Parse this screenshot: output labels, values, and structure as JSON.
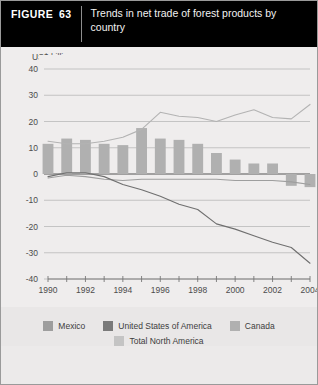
{
  "figure": {
    "tag_word": "FIGURE",
    "tag_number": "63",
    "title": "Trends in net trade of forest products by country"
  },
  "legend": {
    "position": "bottom",
    "rows": [
      [
        {
          "label": "Mexico",
          "color": "#9e9e9e",
          "kind": "line"
        },
        {
          "label": "United States of America",
          "color": "#7a7a7a",
          "kind": "line"
        },
        {
          "label": "Canada",
          "color": "#b0b0b0",
          "kind": "bar"
        }
      ],
      [
        {
          "label": "Total North America",
          "color": "#c4c4c4",
          "kind": "line"
        }
      ]
    ]
  },
  "chart_data": {
    "type": "bar",
    "title": "Trends in net trade of forest products by country",
    "xlabel": "",
    "ylabel": "US$ billion",
    "ylim": [
      -40,
      40
    ],
    "yticks": [
      40,
      30,
      20,
      10,
      0,
      -10,
      -20,
      -30,
      -40
    ],
    "ytick_labels": [
      "40",
      "30",
      "20",
      "10",
      "0",
      "-10",
      "-20",
      "-30",
      "-40"
    ],
    "grid": true,
    "x": [
      1990,
      1991,
      1992,
      1993,
      1994,
      1995,
      1996,
      1997,
      1998,
      1999,
      2000,
      2001,
      2002,
      2003,
      2004
    ],
    "xtick_labels": [
      "1990",
      "",
      "1992",
      "",
      "1994",
      "",
      "1996",
      "",
      "1998",
      "",
      "2000",
      "",
      "2002",
      "",
      "2004"
    ],
    "xtick_labels_shown": [
      "1990",
      "1992",
      "1994",
      "1996",
      "1998",
      "2000",
      "2002",
      "2004"
    ],
    "categories": [
      "1990",
      "1991",
      "1992",
      "1993",
      "1994",
      "1995",
      "1996",
      "1997",
      "1998",
      "1999",
      "2000",
      "2001",
      "2002",
      "2003",
      "2004"
    ],
    "series": [
      {
        "name": "Canada",
        "kind": "bar",
        "color": "#b0b0b0",
        "values": [
          11.5,
          13.5,
          13.0,
          11.5,
          11.0,
          17.5,
          13.5,
          13.0,
          11.5,
          8.0,
          5.5,
          4.0,
          4.0,
          -4.5,
          -5.0
        ]
      },
      {
        "name": "Total North America",
        "kind": "line",
        "color": "#b3b3b3",
        "values": [
          12.5,
          11.5,
          11.5,
          12.5,
          14.0,
          17.0,
          23.5,
          22.0,
          21.5,
          20.0,
          22.5,
          24.5,
          21.5,
          21.0,
          26.5
        ]
      },
      {
        "name": "Mexico",
        "kind": "line",
        "color": "#9e9e9e",
        "values": [
          -1.5,
          -0.5,
          -1.0,
          -2.0,
          -2.5,
          -2.0,
          -2.0,
          -2.0,
          -2.0,
          -2.0,
          -2.5,
          -2.5,
          -2.5,
          -3.0,
          -4.0
        ]
      },
      {
        "name": "United States of America",
        "kind": "line",
        "color": "#6f6f6f",
        "values": [
          -1.0,
          0.5,
          0.5,
          -1.0,
          -4.0,
          -6.0,
          -8.5,
          -11.5,
          -13.5,
          -19.0,
          -21.0,
          -23.5,
          -26.0,
          -28.0,
          -34.0
        ]
      }
    ]
  }
}
